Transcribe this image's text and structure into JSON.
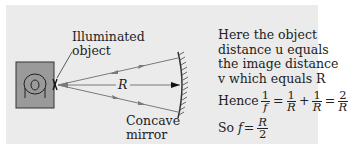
{
  "diagram": {
    "object_label": [
      "Illuminated",
      "object"
    ],
    "distance_label": "R",
    "mirror_label": [
      "Concave",
      "mirror"
    ],
    "explanation": [
      "Here the object",
      "distance u equals",
      "the image distance",
      "v which equals R"
    ],
    "equation1": {
      "prefix": "Hence",
      "terms": [
        {
          "num": "1",
          "den": "f"
        },
        {
          "op": "="
        },
        {
          "num": "1",
          "den": "R"
        },
        {
          "op": "+"
        },
        {
          "num": "1",
          "den": "R"
        },
        {
          "op": "="
        },
        {
          "num": "2",
          "den": "R"
        }
      ]
    },
    "equation2": {
      "prefix": "So",
      "lhs": "f",
      "op": "=",
      "num": "R",
      "den": "2"
    },
    "colors": {
      "panel": "#ebebeb",
      "object_box": "#9a9a9a",
      "ray": "#7a7a7a",
      "text": "#222222"
    }
  }
}
